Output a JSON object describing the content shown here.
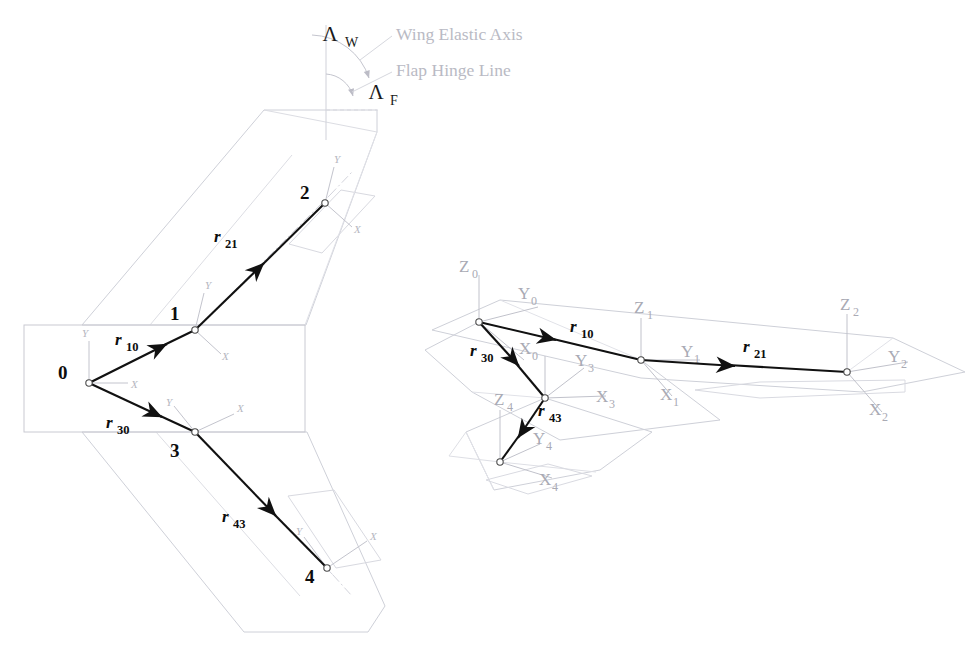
{
  "figure": {
    "background": "#ffffff",
    "width": 972,
    "height": 645,
    "colors": {
      "vector_black": "#111111",
      "planform_gray": "#c9c9cf",
      "planform_gray_light": "#dedee4",
      "axis_gray": "#b5b5bd",
      "axis_label_gray": "#a8a8b2",
      "annotation_gray": "#bcbcc6",
      "node_outline": "#555555"
    }
  },
  "annotations": {
    "sweep_wing_symbol": "Λ",
    "sweep_wing_subscript": "W",
    "sweep_flap_symbol": "Λ",
    "sweep_flap_subscript": "F",
    "wing_elastic_axis_label": "Wing Elastic Axis",
    "flap_hinge_line_label": "Flap Hinge Line"
  },
  "left_view": {
    "name": "planform-top-view",
    "nodes": [
      {
        "id": "0",
        "label": "0",
        "x": 89,
        "y": 383,
        "label_x": 64,
        "label_y": 372
      },
      {
        "id": "1",
        "label": "1",
        "x": 195,
        "y": 330,
        "label_x": 176,
        "label_y": 311
      },
      {
        "id": "2",
        "label": "2",
        "x": 325,
        "y": 203,
        "label_x": 306,
        "label_y": 193
      },
      {
        "id": "3",
        "label": "3",
        "x": 195,
        "y": 432,
        "label_x": 176,
        "label_y": 452
      },
      {
        "id": "4",
        "label": "4",
        "x": 327,
        "y": 568,
        "label_x": 310,
        "label_y": 576
      }
    ],
    "vectors": [
      {
        "name": "r10",
        "label": "r",
        "sub": "10",
        "x1": 89,
        "y1": 383,
        "x2": 195,
        "y2": 330,
        "label_x": 128,
        "label_y": 338
      },
      {
        "name": "r21",
        "label": "r",
        "sub": "21",
        "x1": 195,
        "y1": 330,
        "x2": 325,
        "y2": 203,
        "label_x": 228,
        "label_y": 237
      },
      {
        "name": "r30",
        "label": "r",
        "sub": "30",
        "x1": 89,
        "y1": 383,
        "x2": 195,
        "y2": 432,
        "label_x": 120,
        "label_y": 422
      },
      {
        "name": "r43",
        "label": "r",
        "sub": "43",
        "x1": 195,
        "y1": 432,
        "x2": 327,
        "y2": 568,
        "label_x": 233,
        "label_y": 516
      }
    ],
    "local_axes": [
      {
        "node": "0",
        "x_label": "X",
        "y_label": "Y",
        "x_lx": 131,
        "x_ly": 385,
        "y_lx": 85,
        "y_ly": 337
      },
      {
        "node": "1",
        "x_label": "X",
        "y_label": "Y",
        "x_lx": 220,
        "x_ly": 357,
        "y_lx": 207,
        "y_ly": 289
      },
      {
        "node": "2",
        "x_label": "X",
        "y_label": "Y",
        "x_lx": 352,
        "x_ly": 230,
        "y_lx": 336,
        "y_ly": 163
      },
      {
        "node": "3",
        "x_label": "X",
        "y_label": "Y",
        "x_lx": 236,
        "x_ly": 417,
        "y_lx": 162,
        "y_ly": 411
      },
      {
        "node": "4",
        "x_label": "X",
        "y_label": "Y",
        "x_lx": 370,
        "x_ly": 543,
        "y_lx": 293,
        "y_ly": 533
      }
    ]
  },
  "right_view": {
    "name": "perspective-3d-view",
    "nodes": [
      {
        "id": "0",
        "x": 479,
        "y": 322
      },
      {
        "id": "1",
        "x": 641,
        "y": 360
      },
      {
        "id": "2",
        "x": 847,
        "y": 372
      },
      {
        "id": "3",
        "x": 545,
        "y": 398
      },
      {
        "id": "4",
        "x": 500,
        "y": 462
      }
    ],
    "vectors": [
      {
        "name": "r10",
        "label": "r",
        "sub": "10",
        "x1": 479,
        "y1": 322,
        "x2": 641,
        "y2": 360,
        "label_x": 571,
        "label_y": 328
      },
      {
        "name": "r21",
        "label": "r",
        "sub": "21",
        "x1": 641,
        "y1": 360,
        "x2": 847,
        "y2": 372,
        "label_x": 744,
        "label_y": 348
      },
      {
        "name": "r30",
        "label": "r",
        "sub": "30",
        "x1": 479,
        "y1": 322,
        "x2": 545,
        "y2": 398,
        "label_x": 473,
        "label_y": 352
      },
      {
        "name": "r43",
        "label": "r",
        "sub": "43",
        "x1": 545,
        "y1": 398,
        "x2": 500,
        "y2": 462,
        "label_x": 540,
        "label_y": 412
      }
    ],
    "frame_labels": [
      {
        "text": "Z",
        "sub": "0",
        "x": 466,
        "y": 266
      },
      {
        "text": "Y",
        "sub": "0",
        "x": 524,
        "y": 293
      },
      {
        "text": "X",
        "sub": "0",
        "x": 525,
        "y": 348
      },
      {
        "text": "Z",
        "sub": "1",
        "x": 642,
        "y": 310
      },
      {
        "text": "Y",
        "sub": "1",
        "x": 686,
        "y": 355
      },
      {
        "text": "X",
        "sub": "1",
        "x": 664,
        "y": 396
      },
      {
        "text": "Z",
        "sub": "2",
        "x": 847,
        "y": 306
      },
      {
        "text": "Y",
        "sub": "2",
        "x": 893,
        "y": 358
      },
      {
        "text": "X",
        "sub": "2",
        "x": 875,
        "y": 410
      },
      {
        "text": "Y",
        "sub": "3",
        "x": 582,
        "y": 363
      },
      {
        "text": "X",
        "sub": "3",
        "x": 603,
        "y": 398
      },
      {
        "text": "Z",
        "sub": "4",
        "x": 500,
        "y": 400
      },
      {
        "text": "Y",
        "sub": "4",
        "x": 538,
        "y": 440
      },
      {
        "text": "X",
        "sub": "4",
        "x": 545,
        "y": 480
      }
    ]
  }
}
